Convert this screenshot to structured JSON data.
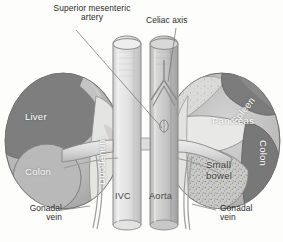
{
  "figure": {
    "type": "anatomical-illustration",
    "width": 283,
    "height": 242,
    "style": "grayscale pen-and-ink medical illustration"
  },
  "callouts": [
    {
      "id": "sma",
      "line1": "Superior mesenteric",
      "line2": "artery"
    },
    {
      "id": "celiac",
      "line1": "Celiac axis",
      "line2": ""
    },
    {
      "id": "gonadal_left",
      "line1": "Gonadal",
      "line2": "vein"
    },
    {
      "id": "gonadal_right",
      "line1": "Gonadal",
      "line2": "vein"
    }
  ],
  "organ_labels": [
    {
      "id": "liver",
      "text": "Liver"
    },
    {
      "id": "duodenum",
      "text": "Duodenum"
    },
    {
      "id": "colon_left",
      "text": "Colon"
    },
    {
      "id": "spleen",
      "text": "Spleen"
    },
    {
      "id": "pancreas",
      "text": "Pancreas"
    },
    {
      "id": "colon_right",
      "text": "Colon"
    },
    {
      "id": "small_bowel_1",
      "text": "Small"
    },
    {
      "id": "small_bowel_2",
      "text": "bowel"
    }
  ],
  "vessel_labels": [
    {
      "id": "ivc",
      "text": "IVC"
    },
    {
      "id": "aorta",
      "text": "Aorta"
    }
  ],
  "caption": {
    "text": ""
  },
  "colors": {
    "background": "#fdfdfc",
    "ink": "#6f6f6f",
    "organ_dark": "#7c7c7c",
    "organ_mid": "#9e9e9e",
    "organ_light": "#c6c6c6",
    "organ_pale": "#dcdcda",
    "vessel_light": "#dedede",
    "vessel_mid": "#bdbdbd",
    "label_on_organ": "#ffffff",
    "label_text": "#2a2a2a"
  }
}
